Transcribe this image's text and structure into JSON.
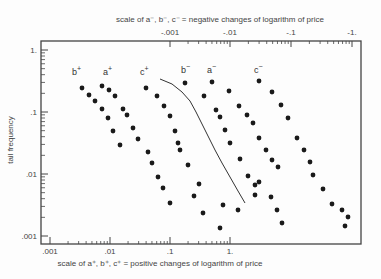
{
  "chart_data": {
    "type": "scatter",
    "title": "",
    "top_axis_label": "scale of a⁻, b⁻, c⁻ = negative changes of logarithm of price",
    "xlabel": "scale of a⁺, b⁺, c⁺ = positive changes of logarithm of price",
    "ylabel": "tail frequency",
    "x_scale": "log",
    "y_scale": "log",
    "xlim": [
      0.001,
      1
    ],
    "ylim": [
      0.001,
      1
    ],
    "bottom_ticks": [
      ".001",
      ".01",
      ".1",
      "1."
    ],
    "top_ticks": [
      "-.001",
      "-.01",
      "-.1",
      "-1."
    ],
    "y_ticks": [
      ".001",
      ".01",
      ".1",
      "1."
    ],
    "grid": false,
    "series": [
      {
        "name": "b+",
        "label": "b",
        "sign": "+",
        "label_pos": [
          72,
          75
        ],
        "points_px": [
          [
            82,
            88
          ],
          [
            89,
            95
          ],
          [
            95,
            101
          ],
          [
            102,
            109
          ],
          [
            108,
            118
          ],
          [
            113,
            131
          ],
          [
            120,
            145
          ]
        ]
      },
      {
        "name": "a+",
        "label": "a",
        "sign": "+",
        "label_pos": [
          103,
          75
        ],
        "points_px": [
          [
            102,
            86
          ],
          [
            109,
            90
          ],
          [
            115,
            96
          ],
          [
            123,
            109
          ],
          [
            127,
            115
          ],
          [
            133,
            128
          ],
          [
            138,
            139
          ],
          [
            148,
            152
          ],
          [
            152,
            163
          ],
          [
            158,
            177
          ],
          [
            163,
            188
          ],
          [
            170,
            203
          ]
        ]
      },
      {
        "name": "c+",
        "label": "c",
        "sign": "+",
        "label_pos": [
          140,
          75
        ],
        "points_px": [
          [
            146,
            88
          ],
          [
            157,
            96
          ],
          [
            164,
            106
          ],
          [
            170,
            116
          ],
          [
            175,
            131
          ],
          [
            178,
            143
          ],
          [
            180,
            150
          ],
          [
            188,
            165
          ],
          [
            199,
            184
          ],
          [
            194,
            196
          ],
          [
            203,
            213
          ]
        ]
      },
      {
        "name": "b-",
        "label": "b",
        "sign": "−",
        "label_pos": [
          181,
          73
        ],
        "points_px": [
          [
            185,
            83
          ],
          [
            204,
            96
          ],
          [
            216,
            110
          ],
          [
            220,
            117
          ],
          [
            225,
            130
          ],
          [
            230,
            143
          ],
          [
            240,
            159
          ],
          [
            248,
            176
          ],
          [
            255,
            185
          ],
          [
            223,
            205
          ],
          [
            220,
            228
          ],
          [
            255,
            195
          ],
          [
            238,
            210
          ]
        ]
      },
      {
        "name": "a-",
        "label": "a",
        "sign": "−",
        "label_pos": [
          207,
          73
        ],
        "points_px": [
          [
            212,
            82
          ],
          [
            229,
            91
          ],
          [
            239,
            106
          ],
          [
            247,
            115
          ],
          [
            253,
            123
          ],
          [
            259,
            138
          ],
          [
            266,
            150
          ],
          [
            272,
            160
          ],
          [
            278,
            167
          ],
          [
            259,
            182
          ],
          [
            271,
            197
          ],
          [
            277,
            210
          ],
          [
            282,
            223
          ]
        ]
      },
      {
        "name": "c-",
        "label": "c",
        "sign": "−",
        "label_pos": [
          254,
          73
        ],
        "points_px": [
          [
            259,
            81
          ],
          [
            272,
            92
          ],
          [
            281,
            105
          ],
          [
            288,
            118
          ],
          [
            297,
            138
          ],
          [
            304,
            150
          ],
          [
            310,
            162
          ],
          [
            313,
            175
          ],
          [
            323,
            189
          ],
          [
            332,
            204
          ],
          [
            342,
            210
          ],
          [
            345,
            226
          ],
          [
            348,
            217
          ]
        ]
      }
    ],
    "reference_curve": {
      "description": "solid theoretical curve from upper-left to lower-right between c+ and a- clusters",
      "points_px": [
        [
          160,
          79
        ],
        [
          172,
          84
        ],
        [
          182,
          92
        ],
        [
          190,
          101
        ],
        [
          196,
          112
        ],
        [
          202,
          124
        ],
        [
          208,
          136
        ],
        [
          215,
          150
        ],
        [
          222,
          163
        ],
        [
          230,
          177
        ],
        [
          238,
          191
        ],
        [
          245,
          203
        ]
      ]
    }
  }
}
